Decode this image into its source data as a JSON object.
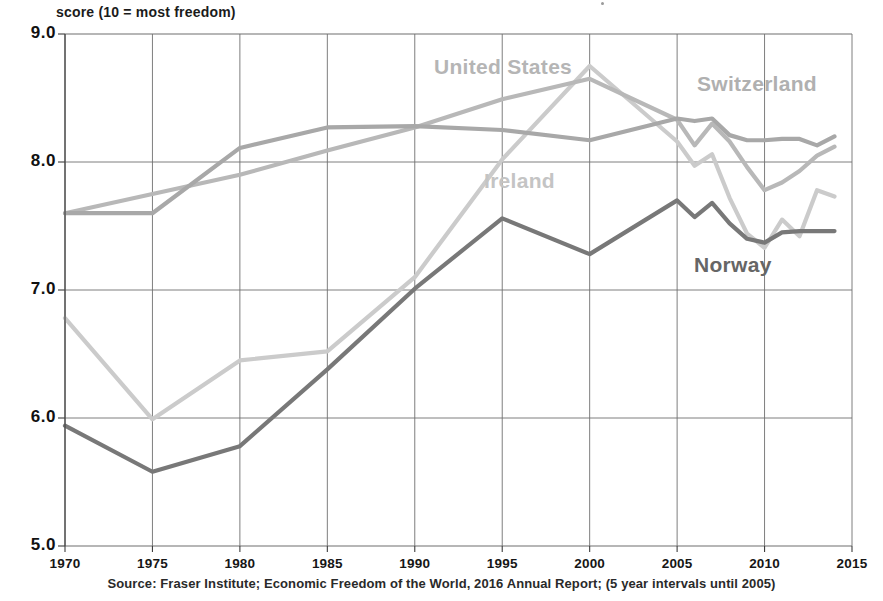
{
  "chart_data": {
    "type": "line",
    "title": "",
    "ylabel": "score (10 = most freedom)",
    "xlabel": "",
    "ylim": [
      5.0,
      9.0
    ],
    "xlim": [
      1970,
      2015
    ],
    "grid": true,
    "legend_position": "inline-annotations",
    "ytick_labels": [
      "9.0",
      "8.0",
      "7.0",
      "6.0",
      "5.0"
    ],
    "ytick_values": [
      9.0,
      8.0,
      7.0,
      6.0,
      5.0
    ],
    "xtick_labels": [
      "1970",
      "1975",
      "1980",
      "1985",
      "1990",
      "1995",
      "2000",
      "2005",
      "2010",
      "2015"
    ],
    "xtick_values": [
      1970,
      1975,
      1980,
      1985,
      1990,
      1995,
      2000,
      2005,
      2010,
      2015
    ],
    "source": "Source: Fraser Institute; Economic Freedom of the World, 2016  Annual Report; (5 year intervals until 2005)",
    "note": "5 year intervals until 2005, annual thereafter",
    "series": [
      {
        "name": "Switzerland",
        "color": "#a8a8a8",
        "label_color": "#b0b0b0",
        "label_x": 697,
        "label_y": 72,
        "x": [
          1970,
          1975,
          1980,
          1985,
          1990,
          1995,
          2000,
          2005,
          2006,
          2007,
          2008,
          2009,
          2010,
          2011,
          2012,
          2013,
          2014
        ],
        "y": [
          7.6,
          7.6,
          8.11,
          8.27,
          8.28,
          8.25,
          8.17,
          8.34,
          8.32,
          8.34,
          8.21,
          8.17,
          8.17,
          8.18,
          8.18,
          8.13,
          8.2
        ]
      },
      {
        "name": "United States",
        "color": "#b8b8b8",
        "label_color": "#b5b5b5",
        "label_x": 434,
        "label_y": 55,
        "x": [
          1970,
          1975,
          1980,
          1985,
          1990,
          1995,
          2000,
          2005,
          2006,
          2007,
          2008,
          2009,
          2010,
          2011,
          2012,
          2013,
          2014
        ],
        "y": [
          7.6,
          7.75,
          7.9,
          8.09,
          8.27,
          8.49,
          8.65,
          8.33,
          8.13,
          8.3,
          8.16,
          7.96,
          7.78,
          7.84,
          7.93,
          8.05,
          8.12
        ]
      },
      {
        "name": "Ireland",
        "color": "#cbcbcb",
        "label_color": "#c4c4c4",
        "label_x": 484,
        "label_y": 169,
        "x": [
          1970,
          1975,
          1980,
          1985,
          1990,
          1995,
          2000,
          2005,
          2006,
          2007,
          2008,
          2009,
          2010,
          2011,
          2012,
          2013,
          2014
        ],
        "y": [
          6.78,
          5.99,
          6.45,
          6.52,
          7.1,
          8.02,
          8.75,
          8.16,
          7.97,
          8.06,
          7.72,
          7.44,
          7.33,
          7.55,
          7.42,
          7.78,
          7.73
        ]
      },
      {
        "name": "Norway",
        "color": "#787878",
        "label_color": "#666666",
        "label_x": 694,
        "label_y": 253,
        "x": [
          1970,
          1975,
          1980,
          1985,
          1990,
          1995,
          2000,
          2005,
          2006,
          2007,
          2008,
          2009,
          2010,
          2011,
          2012,
          2013,
          2014
        ],
        "y": [
          5.94,
          5.58,
          5.78,
          6.38,
          7.01,
          7.56,
          7.28,
          7.7,
          7.57,
          7.68,
          7.52,
          7.4,
          7.37,
          7.45,
          7.46,
          7.46,
          7.46
        ]
      }
    ]
  },
  "axis": {
    "y_caption": "score (10 = most freedom)"
  },
  "icons": {
    "dust_speck": "speck-icon"
  }
}
